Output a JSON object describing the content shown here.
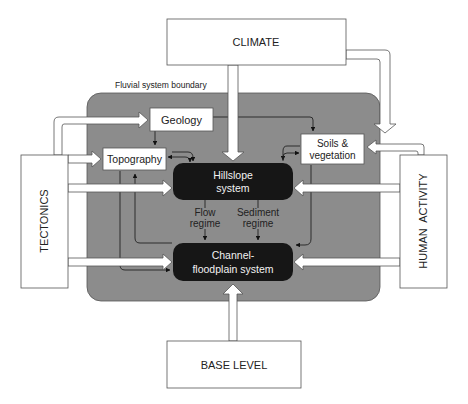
{
  "diagram": {
    "boundary_label": "Fluvial system boundary",
    "external_drivers": {
      "climate": "CLIMATE",
      "tectonics": "TECTONICS",
      "human_activity": "HUMAN  ACTIVITY",
      "base_level": "BASE LEVEL"
    },
    "internal_components": {
      "geology": "Geology",
      "topography": "Topography",
      "soils_line1": "Soils &",
      "soils_line2": "vegetation"
    },
    "core_systems": {
      "hillslope_line1": "Hillslope",
      "hillslope_line2": "system",
      "channel_line1": "Channel-",
      "channel_line2": "floodplain system"
    },
    "flows": {
      "flow_line1": "Flow",
      "flow_line2": "regime",
      "sediment_line1": "Sediment",
      "sediment_line2": "regime"
    },
    "colors": {
      "boundary_fill": "#8c8c8c",
      "core_fill": "#161616",
      "box_fill": "#ffffff",
      "line": "#333333"
    }
  }
}
